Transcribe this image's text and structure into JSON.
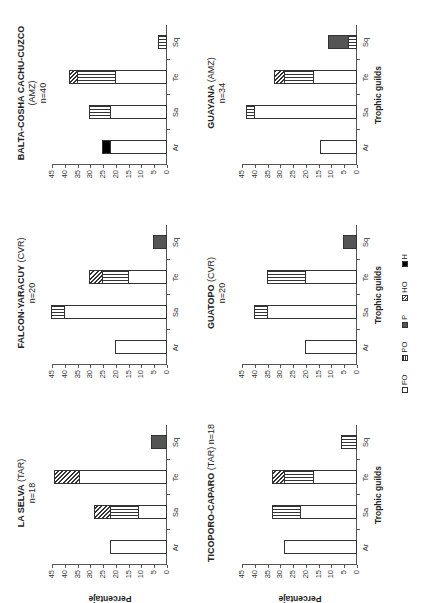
{
  "figure": {
    "ylabel": "Percentaje",
    "xlabel": "Trophic guilds",
    "categories": [
      "Ar",
      "Sa",
      "Te",
      "Sq"
    ],
    "yticks": [
      0,
      5,
      10,
      15,
      20,
      25,
      30,
      35,
      40,
      45
    ],
    "legend": [
      {
        "key": "FO",
        "label": "FO"
      },
      {
        "key": "PO",
        "label": "PO"
      },
      {
        "key": "P",
        "label": "P"
      },
      {
        "key": "HO",
        "label": "HO"
      },
      {
        "key": "H",
        "label": "H"
      }
    ]
  },
  "chart_data": [
    {
      "type": "bar",
      "stacked": true,
      "title": "LA SELVA (TAR)",
      "title_bold": "LA SELVA",
      "title_rest": "(TAR)",
      "subtitle": "n=18",
      "xlabel": "",
      "ylabel": "Percentaje",
      "ylim": [
        0,
        45
      ],
      "categories": [
        "Ar",
        "Sa",
        "Te",
        "Sq"
      ],
      "series": [
        {
          "name": "FO",
          "values": [
            22,
            11,
            34,
            0
          ]
        },
        {
          "name": "PO",
          "values": [
            0,
            11,
            0,
            0
          ]
        },
        {
          "name": "P",
          "values": [
            0,
            0,
            0,
            6
          ]
        },
        {
          "name": "HO",
          "values": [
            0,
            6,
            10,
            0
          ]
        },
        {
          "name": "H",
          "values": [
            0,
            0,
            0,
            0
          ]
        }
      ]
    },
    {
      "type": "bar",
      "stacked": true,
      "title": "FALCON-YARACUY (CVR)",
      "title_bold": "FALCON-YARACUY",
      "title_rest": "(CVR)",
      "subtitle": "n=20",
      "xlabel": "",
      "ylabel": "",
      "ylim": [
        0,
        45
      ],
      "categories": [
        "Ar",
        "Sa",
        "Te",
        "Sq"
      ],
      "series": [
        {
          "name": "FO",
          "values": [
            20,
            40,
            15,
            0
          ]
        },
        {
          "name": "PO",
          "values": [
            0,
            5,
            10,
            0
          ]
        },
        {
          "name": "P",
          "values": [
            0,
            0,
            0,
            5
          ]
        },
        {
          "name": "HO",
          "values": [
            0,
            0,
            5,
            0
          ]
        },
        {
          "name": "H",
          "values": [
            0,
            0,
            0,
            0
          ]
        }
      ]
    },
    {
      "type": "bar",
      "stacked": true,
      "title": "BALTA-COSHA CACHU-CUZCO (AMZ)",
      "title_bold": "BALTA-COSHA CACHU-CUZCO",
      "title_rest": "(AMZ)",
      "subtitle": "n=40",
      "xlabel": "",
      "ylabel": "",
      "ylim": [
        0,
        45
      ],
      "categories": [
        "Ar",
        "Sa",
        "Te",
        "Sq"
      ],
      "series": [
        {
          "name": "FO",
          "values": [
            22,
            22,
            20,
            0
          ]
        },
        {
          "name": "PO",
          "values": [
            0,
            8,
            15,
            3
          ]
        },
        {
          "name": "P",
          "values": [
            0,
            0,
            0,
            0
          ]
        },
        {
          "name": "HO",
          "values": [
            0,
            0,
            3,
            0
          ]
        },
        {
          "name": "H",
          "values": [
            3,
            0,
            0,
            0
          ]
        }
      ]
    },
    {
      "type": "bar",
      "stacked": true,
      "title": "TICOPORO-CAPARO (TAR)",
      "title_bold": "TICOPORO-CAPARO",
      "title_rest": "(TAR) n=18",
      "subtitle": "",
      "xlabel": "Trophic guilds",
      "ylabel": "Percentaje",
      "ylim": [
        0,
        45
      ],
      "categories": [
        "Ar",
        "Sa",
        "Te",
        "Sq"
      ],
      "series": [
        {
          "name": "FO",
          "values": [
            28,
            22,
            17,
            0
          ]
        },
        {
          "name": "PO",
          "values": [
            0,
            11,
            11,
            6
          ]
        },
        {
          "name": "P",
          "values": [
            0,
            0,
            0,
            0
          ]
        },
        {
          "name": "HO",
          "values": [
            0,
            0,
            5,
            0
          ]
        },
        {
          "name": "H",
          "values": [
            0,
            0,
            0,
            0
          ]
        }
      ]
    },
    {
      "type": "bar",
      "stacked": true,
      "title": "GUATOPO (CVR)",
      "title_bold": "GUATOPO",
      "title_rest": "(CVR)",
      "subtitle": "n=20",
      "xlabel": "Trophic guilds",
      "ylabel": "",
      "ylim": [
        0,
        45
      ],
      "categories": [
        "Ar",
        "Sa",
        "Te",
        "Sq"
      ],
      "series": [
        {
          "name": "FO",
          "values": [
            20,
            35,
            20,
            0
          ]
        },
        {
          "name": "PO",
          "values": [
            0,
            5,
            15,
            0
          ]
        },
        {
          "name": "P",
          "values": [
            0,
            0,
            0,
            5
          ]
        },
        {
          "name": "HO",
          "values": [
            0,
            0,
            0,
            0
          ]
        },
        {
          "name": "H",
          "values": [
            0,
            0,
            0,
            0
          ]
        }
      ]
    },
    {
      "type": "bar",
      "stacked": true,
      "title": "GUAYANA (AMZ)",
      "title_bold": "GUAYANA",
      "title_rest": "(AMZ)",
      "subtitle": "n=34",
      "xlabel": "Trophic guilds",
      "ylabel": "",
      "ylim": [
        0,
        45
      ],
      "categories": [
        "Ar",
        "Sa",
        "Te",
        "Sq"
      ],
      "series": [
        {
          "name": "FO",
          "values": [
            14,
            40,
            17,
            0
          ]
        },
        {
          "name": "PO",
          "values": [
            0,
            3,
            11,
            3
          ]
        },
        {
          "name": "P",
          "values": [
            0,
            0,
            0,
            8
          ]
        },
        {
          "name": "HO",
          "values": [
            0,
            0,
            4,
            0
          ]
        },
        {
          "name": "H",
          "values": [
            0,
            0,
            0,
            0
          ]
        }
      ]
    }
  ]
}
